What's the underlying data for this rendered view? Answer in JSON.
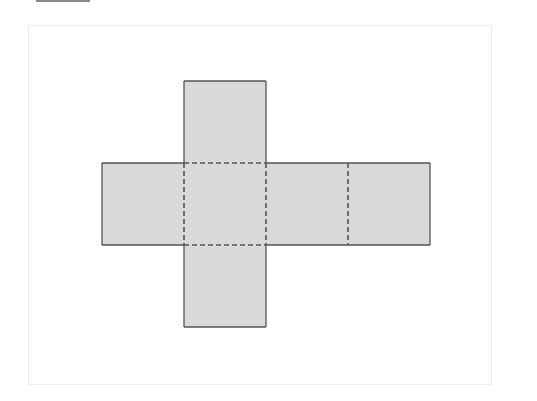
{
  "diagram": {
    "type": "cube-net",
    "layout": "cross",
    "faces": [
      {
        "id": "top",
        "row": 0,
        "col": 1
      },
      {
        "id": "left",
        "row": 1,
        "col": 0
      },
      {
        "id": "center",
        "row": 1,
        "col": 1
      },
      {
        "id": "right-1",
        "row": 1,
        "col": 2
      },
      {
        "id": "right-2",
        "row": 1,
        "col": 3
      },
      {
        "id": "bottom",
        "row": 2,
        "col": 1
      }
    ],
    "face_count": 6,
    "fold_lines": "dashed",
    "outer_edges": "solid",
    "colors": {
      "face_fill": "#d9d9d9",
      "edge_stroke": "#555555",
      "fold_stroke": "#555555",
      "frame_border": "#ececec",
      "top_rule": "#8a8a8a"
    }
  }
}
